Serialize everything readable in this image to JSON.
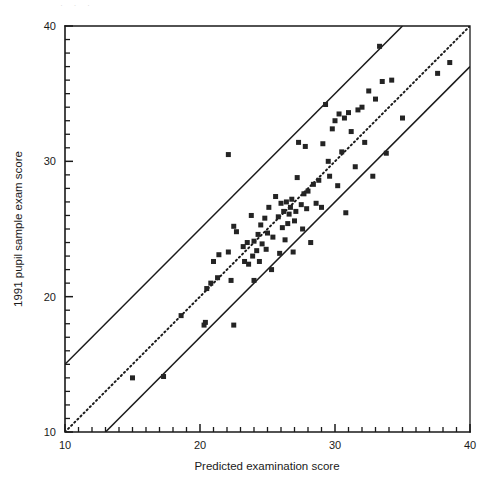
{
  "figure": {
    "type": "scatter-plot",
    "background_color": "#ffffff",
    "foreground_color": "#1a1a1a",
    "marker_color": "#242424"
  },
  "chart_data": {
    "type": "scatter",
    "title": "",
    "xlabel": "Predicted examination score",
    "ylabel": "1991 pupil sample exam score",
    "xlim": [
      10,
      40
    ],
    "ylim": [
      10,
      40
    ],
    "xticks_major": [
      10,
      20,
      30,
      40
    ],
    "yticks_major": [
      10,
      20,
      30,
      40
    ],
    "xtick_labels": [
      "10",
      "20",
      "30",
      "40"
    ],
    "ytick_labels": [
      "10",
      "20",
      "30",
      "40"
    ],
    "minor_tick_step": 1,
    "grid": false,
    "legend": null,
    "marker": "square",
    "marker_size": 5,
    "annotations": [
      {
        "name": "identity-line",
        "style": "dotted",
        "description": "1:1 reference line y = x",
        "from": [
          10,
          10
        ],
        "to": [
          40,
          40
        ]
      },
      {
        "name": "upper-confidence-line",
        "style": "solid",
        "description": "upper band, y = x + 5",
        "from": [
          10,
          15
        ],
        "to": [
          35,
          40
        ]
      },
      {
        "name": "lower-confidence-line",
        "style": "solid",
        "description": "lower band, y = x - 3",
        "from": [
          13,
          10
        ],
        "to": [
          40,
          37
        ]
      }
    ],
    "points": [
      [
        15.0,
        14.0
      ],
      [
        17.3,
        14.1
      ],
      [
        18.6,
        18.6
      ],
      [
        20.3,
        17.9
      ],
      [
        20.4,
        18.1
      ],
      [
        20.5,
        20.6
      ],
      [
        21.0,
        22.6
      ],
      [
        20.8,
        21.0
      ],
      [
        21.3,
        21.4
      ],
      [
        21.4,
        23.1
      ],
      [
        22.1,
        30.5
      ],
      [
        22.1,
        23.3
      ],
      [
        22.3,
        21.2
      ],
      [
        22.5,
        17.9
      ],
      [
        22.5,
        25.2
      ],
      [
        22.7,
        24.8
      ],
      [
        23.2,
        23.7
      ],
      [
        23.3,
        22.6
      ],
      [
        23.5,
        24.0
      ],
      [
        23.6,
        22.4
      ],
      [
        23.8,
        26.0
      ],
      [
        23.9,
        23.0
      ],
      [
        24.0,
        24.1
      ],
      [
        24.0,
        21.2
      ],
      [
        24.2,
        23.4
      ],
      [
        24.3,
        24.6
      ],
      [
        24.4,
        22.6
      ],
      [
        24.5,
        25.3
      ],
      [
        24.6,
        23.9
      ],
      [
        24.8,
        25.8
      ],
      [
        24.9,
        23.5
      ],
      [
        25.0,
        24.7
      ],
      [
        25.1,
        26.6
      ],
      [
        25.3,
        22.0
      ],
      [
        25.4,
        24.4
      ],
      [
        25.6,
        27.4
      ],
      [
        25.8,
        25.9
      ],
      [
        25.9,
        23.2
      ],
      [
        26.0,
        26.9
      ],
      [
        26.1,
        25.1
      ],
      [
        26.2,
        26.3
      ],
      [
        26.3,
        24.2
      ],
      [
        26.4,
        27.0
      ],
      [
        26.5,
        25.4
      ],
      [
        26.6,
        26.1
      ],
      [
        26.7,
        26.6
      ],
      [
        26.8,
        27.2
      ],
      [
        26.9,
        23.3
      ],
      [
        27.0,
        25.6
      ],
      [
        27.1,
        26.3
      ],
      [
        27.2,
        28.8
      ],
      [
        27.3,
        31.4
      ],
      [
        27.5,
        26.8
      ],
      [
        27.6,
        25.0
      ],
      [
        27.7,
        27.6
      ],
      [
        27.8,
        31.1
      ],
      [
        27.9,
        26.5
      ],
      [
        28.0,
        27.8
      ],
      [
        28.2,
        24.0
      ],
      [
        28.4,
        28.3
      ],
      [
        28.6,
        26.9
      ],
      [
        28.8,
        28.6
      ],
      [
        29.0,
        26.6
      ],
      [
        29.1,
        31.3
      ],
      [
        29.3,
        34.2
      ],
      [
        29.5,
        30.0
      ],
      [
        29.6,
        28.9
      ],
      [
        29.8,
        32.4
      ],
      [
        30.0,
        33.0
      ],
      [
        30.2,
        28.2
      ],
      [
        30.3,
        33.5
      ],
      [
        30.5,
        30.7
      ],
      [
        30.7,
        33.2
      ],
      [
        30.8,
        26.2
      ],
      [
        31.0,
        33.6
      ],
      [
        31.2,
        32.2
      ],
      [
        31.5,
        29.6
      ],
      [
        31.7,
        33.8
      ],
      [
        32.0,
        34.0
      ],
      [
        32.2,
        31.4
      ],
      [
        32.5,
        35.2
      ],
      [
        32.8,
        28.9
      ],
      [
        33.0,
        34.6
      ],
      [
        33.3,
        38.5
      ],
      [
        33.5,
        35.9
      ],
      [
        33.8,
        30.6
      ],
      [
        34.2,
        36.0
      ],
      [
        35.0,
        33.2
      ],
      [
        37.6,
        36.5
      ],
      [
        38.5,
        37.3
      ]
    ]
  },
  "axes": {
    "x_axis_name": "x-axis",
    "y_axis_name": "y-axis"
  },
  "artifacts": {
    "top_smudge_text": "· · ·"
  }
}
